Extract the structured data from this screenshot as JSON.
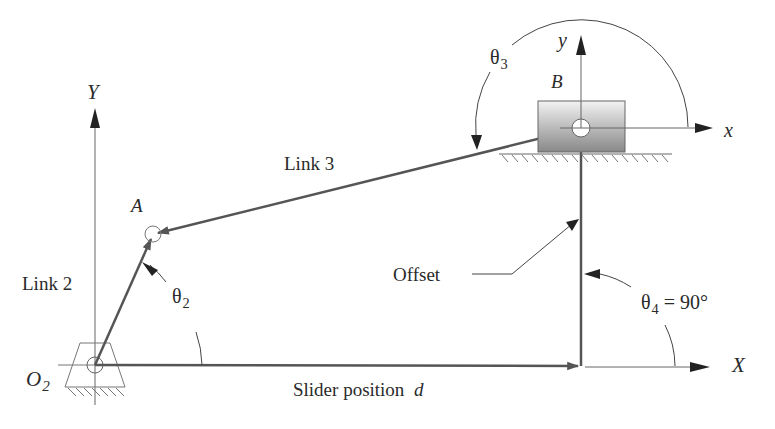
{
  "diagram": {
    "labels": {
      "Y_axis": "Y",
      "X_axis": "X",
      "y_local": "y",
      "x_local": "x",
      "point_A": "A",
      "point_B": "B",
      "O2_main": "O",
      "O2_sub": "2",
      "link2": "Link 2",
      "link3": "Link 3",
      "offset": "Offset",
      "slider_position": "Slider position",
      "slider_position_var": "d",
      "theta2_main": "θ",
      "theta2_sub": "2",
      "theta3_main": "θ",
      "theta3_sub": "3",
      "theta4_main": "θ",
      "theta4_sub": "4",
      "theta4_value": " = 90°"
    },
    "points": {
      "O2": [
        95,
        365
      ],
      "A": [
        153,
        234
      ],
      "B": [
        581,
        128
      ],
      "slider_foot": [
        581,
        365
      ]
    },
    "colors": {
      "link": "#555555",
      "axis": "#666666",
      "text": "#2a2a2a",
      "slider_top": "#eeeeee",
      "slider_bottom": "#8a8a8a"
    }
  }
}
